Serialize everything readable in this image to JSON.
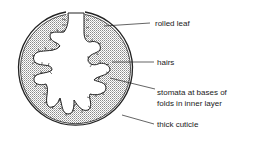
{
  "diagram": {
    "labels": [
      {
        "id": "rolled-leaf",
        "text": "rolled leaf"
      },
      {
        "id": "hairs",
        "text": "hairs"
      },
      {
        "id": "stomata-line1",
        "text": "stomata at bases of"
      },
      {
        "id": "stomata-line2",
        "text": "folds in inner layer"
      },
      {
        "id": "thick-cuticle",
        "text": "thick cuticle"
      }
    ]
  }
}
